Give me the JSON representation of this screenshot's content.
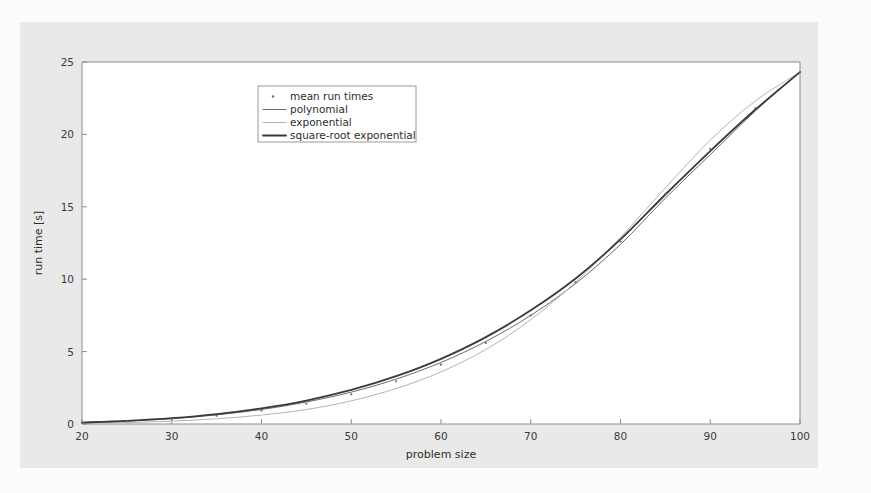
{
  "figure": {
    "background_color": "#e9e9e9",
    "plot_background_color": "#ffffff",
    "page_background_color": "#fbfbfb"
  },
  "chart_data": {
    "type": "line",
    "title": "",
    "xlabel": "problem size",
    "ylabel": "run time [s]",
    "xlim": [
      20,
      100
    ],
    "ylim": [
      0,
      25
    ],
    "xticks": [
      20,
      30,
      40,
      50,
      60,
      70,
      80,
      90,
      100
    ],
    "yticks": [
      0,
      5,
      10,
      15,
      20,
      25
    ],
    "grid": false,
    "legend_position": "upper-left-inset",
    "legend_entries": [
      {
        "label": "mean run times",
        "marker": "dot",
        "color": "#6e6e6e",
        "width": 1.0
      },
      {
        "label": "polynomial",
        "marker": "line",
        "color": "#6b6b6b",
        "width": 1.0
      },
      {
        "label": "exponential",
        "marker": "line",
        "color": "#b4b4b4",
        "width": 1.0
      },
      {
        "label": "square-root exponential",
        "marker": "line",
        "color": "#3a3a3a",
        "width": 1.8
      }
    ],
    "x": [
      20,
      25,
      30,
      35,
      40,
      45,
      50,
      55,
      60,
      65,
      70,
      75,
      80,
      85,
      90,
      95,
      100
    ],
    "series": [
      {
        "name": "mean run times",
        "style": "scatter",
        "color": "#6e6e6e",
        "values": [
          0.08,
          0.18,
          0.33,
          0.57,
          0.92,
          1.4,
          2.05,
          2.95,
          4.1,
          5.6,
          7.5,
          9.8,
          12.6,
          15.9,
          19.0,
          21.8,
          24.3
        ]
      },
      {
        "name": "polynomial",
        "style": "line",
        "color": "#6b6b6b",
        "values": [
          0.09,
          0.2,
          0.37,
          0.63,
          1.0,
          1.52,
          2.2,
          3.1,
          4.25,
          5.7,
          7.5,
          9.7,
          12.4,
          15.6,
          18.6,
          21.6,
          24.3
        ]
      },
      {
        "name": "exponential",
        "style": "line",
        "color": "#b4b4b4",
        "values": [
          0.05,
          0.1,
          0.2,
          0.36,
          0.62,
          1.0,
          1.6,
          2.45,
          3.6,
          5.15,
          7.2,
          9.8,
          12.9,
          16.3,
          19.6,
          22.3,
          24.3
        ]
      },
      {
        "name": "square-root exponential",
        "style": "line",
        "color": "#3a3a3a",
        "values": [
          0.1,
          0.22,
          0.4,
          0.68,
          1.08,
          1.62,
          2.35,
          3.3,
          4.5,
          6.0,
          7.85,
          10.05,
          12.75,
          15.85,
          18.85,
          21.7,
          24.3
        ]
      }
    ]
  }
}
